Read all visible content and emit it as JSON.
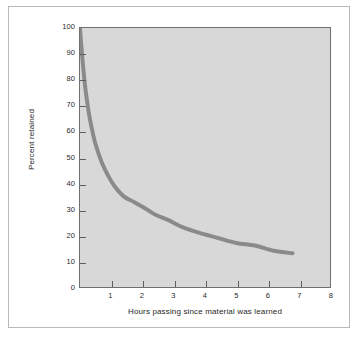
{
  "figure": {
    "background_color": "#ffffff",
    "frame_color": "#b9b9b9"
  },
  "chart_data": {
    "type": "line",
    "title": "",
    "subtitle": "",
    "xlabel": "Hours passing since material was learned",
    "ylabel": "Percent retained",
    "xlim": [
      0,
      8
    ],
    "ylim": [
      0,
      100
    ],
    "xticks": [
      1,
      2,
      3,
      4,
      5,
      6,
      7,
      8
    ],
    "yticks": [
      0,
      10,
      20,
      30,
      40,
      50,
      60,
      70,
      80,
      90,
      100
    ],
    "xtick_labels": [
      "1",
      "2",
      "3",
      "4",
      "5",
      "6",
      "7",
      "8"
    ],
    "ytick_labels": [
      "0",
      "10",
      "20",
      "30",
      "40",
      "50",
      "60",
      "70",
      "80",
      "90",
      "100"
    ],
    "grid": false,
    "legend": false,
    "plot_background_color": "#d8d8d8",
    "axis_color": "#6f6f6f",
    "series": [
      {
        "name": "Forgetting curve",
        "color": "#8a8a8a",
        "line_width": 4,
        "x": [
          0.0,
          0.05,
          0.1,
          0.15,
          0.2,
          0.3,
          0.4,
          0.5,
          0.7,
          0.9,
          1.1,
          1.4,
          1.7,
          2.0,
          2.4,
          2.8,
          3.3,
          3.8,
          4.4,
          5.0,
          5.6,
          6.2,
          6.8
        ],
        "y": [
          100,
          92,
          85,
          79,
          74,
          66,
          60,
          55,
          48,
          43,
          39,
          35,
          33,
          31,
          28,
          26,
          23,
          21,
          19,
          17,
          16,
          14,
          13
        ]
      }
    ],
    "annotations": []
  }
}
